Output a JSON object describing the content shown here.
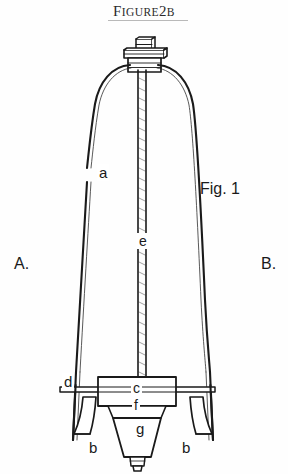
{
  "page": {
    "background_color": "#fefefe",
    "ink_color": "#1a1a1a"
  },
  "caption": {
    "word_figure_initial": "F",
    "word_figure_rest": "IGURE",
    "number": "2",
    "letter": "B",
    "full_text": "FIGURE 2B",
    "underlined": true
  },
  "figure": {
    "name": "Fig. 1",
    "view_labels": {
      "left": "A.",
      "right": "B."
    },
    "callouts": [
      {
        "key": "a",
        "label": "a",
        "target": "curved-left-arm"
      },
      {
        "key": "e",
        "label": "e",
        "target": "central-threaded-rod"
      },
      {
        "key": "d",
        "label": "d",
        "target": "horizontal-cross-bar"
      },
      {
        "key": "c",
        "label": "c",
        "target": "clamp-block"
      },
      {
        "key": "f",
        "label": "f",
        "target": "tapered-collar"
      },
      {
        "key": "g",
        "label": "g",
        "target": "conical-body"
      },
      {
        "key": "b1",
        "label": "b",
        "target": "left-bell-foot"
      },
      {
        "key": "b2",
        "label": "b",
        "target": "right-bell-foot"
      }
    ],
    "parts": [
      {
        "id": "top-nut",
        "name": "square nut at top of rod"
      },
      {
        "id": "top-flange",
        "name": "flange / washer plate"
      },
      {
        "id": "hex-nut",
        "name": "hex nut below flange"
      },
      {
        "id": "left-arm",
        "name": "curved left leg"
      },
      {
        "id": "right-arm",
        "name": "curved right leg"
      },
      {
        "id": "central-rod",
        "name": "central threaded rod"
      },
      {
        "id": "cross-bar",
        "name": "horizontal cross bar"
      },
      {
        "id": "clamp-block",
        "name": "rectangular clamp block"
      },
      {
        "id": "collar",
        "name": "tapered collar"
      },
      {
        "id": "cone",
        "name": "conical body"
      },
      {
        "id": "tip",
        "name": "threaded tip at bottom of cone"
      },
      {
        "id": "left-foot",
        "name": "left bell-shaped foot"
      },
      {
        "id": "right-foot",
        "name": "right bell-shaped foot"
      }
    ]
  }
}
